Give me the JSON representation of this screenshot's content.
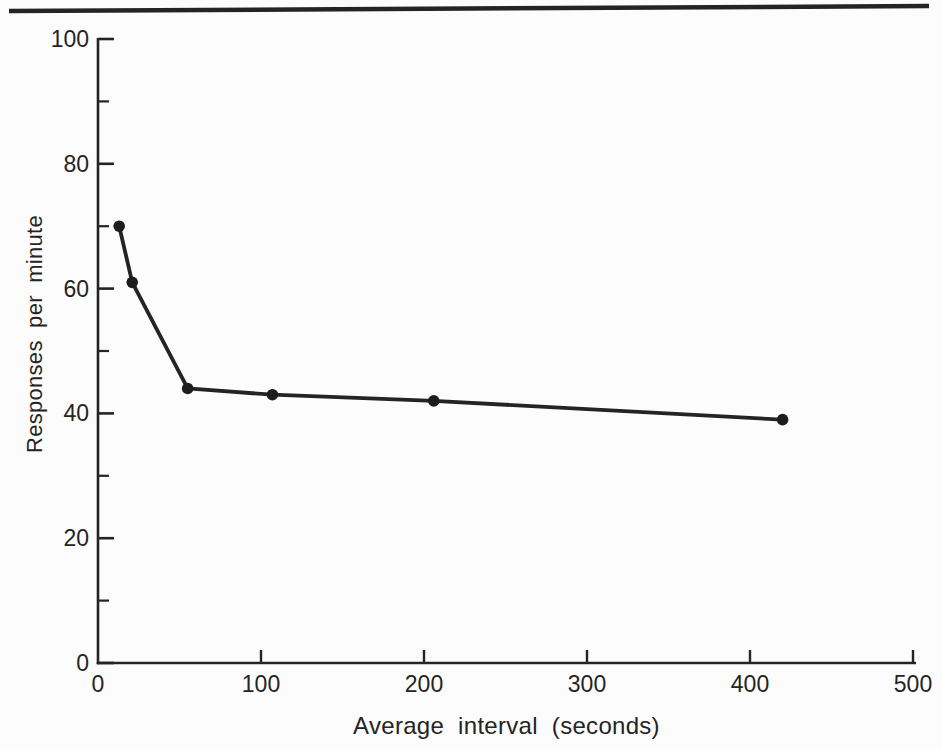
{
  "page": {
    "background": "#fcfcfc",
    "ink": "#242424",
    "top_rule": "horizontal-divider"
  },
  "chart_data": {
    "type": "line",
    "title": "",
    "xlabel": "Average interval (seconds)",
    "ylabel": "Responses per minute",
    "series": [
      {
        "name": "response-rate",
        "x": [
          13,
          21,
          55,
          107,
          206,
          420
        ],
        "y": [
          70,
          61,
          44,
          43,
          42,
          39
        ]
      }
    ],
    "xlim": [
      0,
      500
    ],
    "ylim": [
      0,
      100
    ],
    "x_ticks": [
      0,
      100,
      200,
      300,
      400,
      500
    ],
    "y_ticks": [
      0,
      20,
      40,
      60,
      80,
      100
    ],
    "y_minor_ticks": [
      10,
      30,
      50,
      70,
      90
    ],
    "grid": false,
    "legend": "none",
    "marker": "filled-circle",
    "line_color": "#242424",
    "marker_color": "#1d1d1d"
  }
}
